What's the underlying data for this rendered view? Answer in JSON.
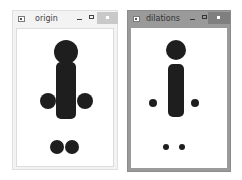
{
  "windows": [
    {
      "title": "origin",
      "state": "inactive",
      "buttons": {
        "minimize": "minimize",
        "maximize": "maximize",
        "close": "close"
      },
      "image": {
        "description": "stick figure made of filled shapes (original)",
        "shape_color": "#1e1e1e",
        "shapes": [
          {
            "type": "circle",
            "part": "head",
            "cx": 65,
            "cy": 50,
            "r": 12
          },
          {
            "type": "rounded-rect",
            "part": "body",
            "x": 55,
            "y": 71,
            "w": 20,
            "h": 57
          },
          {
            "type": "circle",
            "part": "left-hand",
            "cx": 43,
            "cy": 99,
            "r": 8
          },
          {
            "type": "circle",
            "part": "right-hand",
            "cx": 84,
            "cy": 99,
            "r": 8
          },
          {
            "type": "circle",
            "part": "left-foot",
            "cx": 56,
            "cy": 145,
            "r": 7
          },
          {
            "type": "circle",
            "part": "right-foot",
            "cx": 71,
            "cy": 145,
            "r": 7
          }
        ]
      }
    },
    {
      "title": "dilations",
      "state": "active",
      "buttons": {
        "minimize": "minimize",
        "maximize": "maximize",
        "close": "close"
      },
      "image": {
        "description": "stick figure after morphological operation",
        "shape_color": "#1e1e1e",
        "shapes": [
          {
            "type": "circle",
            "part": "head",
            "cx": 176,
            "cy": 50,
            "r": 10
          },
          {
            "type": "rounded-rect",
            "part": "body",
            "x": 167,
            "y": 74,
            "w": 16,
            "h": 53
          },
          {
            "type": "circle",
            "part": "left-hand",
            "cx": 153,
            "cy": 101,
            "r": 4
          },
          {
            "type": "circle",
            "part": "right-hand",
            "cx": 195,
            "cy": 101,
            "r": 4
          },
          {
            "type": "circle",
            "part": "left-foot",
            "cx": 166,
            "cy": 146,
            "r": 3
          },
          {
            "type": "circle",
            "part": "right-foot",
            "cx": 182,
            "cy": 146,
            "r": 3
          }
        ]
      }
    }
  ]
}
